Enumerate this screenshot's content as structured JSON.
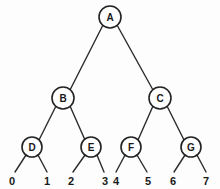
{
  "figure": {
    "name": "binary-tree-diagram",
    "type": "tree",
    "background_color": "#fdfdfd",
    "line_color": "#2b2b2b",
    "node_fill": "#ffffff",
    "node_stroke": "#222222",
    "text_color": "#1a1a1a"
  },
  "nodes": [
    {
      "id": "A",
      "label": "A",
      "cx": 110,
      "cy": 17,
      "r": 11,
      "level": 0
    },
    {
      "id": "B",
      "label": "B",
      "cx": 63,
      "cy": 98,
      "r": 11,
      "level": 1
    },
    {
      "id": "C",
      "label": "C",
      "cx": 160,
      "cy": 98,
      "r": 11,
      "level": 1
    },
    {
      "id": "D",
      "label": "D",
      "cx": 32,
      "cy": 147,
      "r": 10,
      "level": 2
    },
    {
      "id": "E",
      "label": "E",
      "cx": 91,
      "cy": 147,
      "r": 10,
      "level": 2
    },
    {
      "id": "F",
      "label": "F",
      "cx": 131,
      "cy": 147,
      "r": 10,
      "level": 2
    },
    {
      "id": "G",
      "label": "G",
      "cx": 191,
      "cy": 147,
      "r": 10,
      "level": 2
    }
  ],
  "edges": [
    {
      "from": "A",
      "to": "B",
      "x1": 103,
      "y1": 25,
      "x2": 70,
      "y2": 90
    },
    {
      "from": "A",
      "to": "C",
      "x1": 117,
      "y1": 25,
      "x2": 153,
      "y2": 90
    },
    {
      "from": "B",
      "to": "D",
      "x1": 56,
      "y1": 106,
      "x2": 39,
      "y2": 140
    },
    {
      "from": "B",
      "to": "E",
      "x1": 70,
      "y1": 106,
      "x2": 85,
      "y2": 140
    },
    {
      "from": "C",
      "to": "F",
      "x1": 153,
      "y1": 106,
      "x2": 138,
      "y2": 140
    },
    {
      "from": "C",
      "to": "G",
      "x1": 167,
      "y1": 106,
      "x2": 184,
      "y2": 140
    },
    {
      "from": "D",
      "to": "0",
      "x1": 26,
      "y1": 155,
      "x2": 15,
      "y2": 172
    },
    {
      "from": "D",
      "to": "1",
      "x1": 38,
      "y1": 155,
      "x2": 47,
      "y2": 172
    },
    {
      "from": "E",
      "to": "2",
      "x1": 85,
      "y1": 155,
      "x2": 73,
      "y2": 172
    },
    {
      "from": "E",
      "to": "3",
      "x1": 97,
      "y1": 155,
      "x2": 104,
      "y2": 172
    },
    {
      "from": "F",
      "to": "4",
      "x1": 125,
      "y1": 155,
      "x2": 116,
      "y2": 172
    },
    {
      "from": "F",
      "to": "5",
      "x1": 137,
      "y1": 155,
      "x2": 147,
      "y2": 172
    },
    {
      "from": "G",
      "to": "6",
      "x1": 185,
      "y1": 155,
      "x2": 174,
      "y2": 172
    },
    {
      "from": "G",
      "to": "7",
      "x1": 197,
      "y1": 155,
      "x2": 206,
      "y2": 172
    }
  ],
  "leaves": [
    {
      "label": "0",
      "x": 12,
      "y": 181,
      "parent": "D"
    },
    {
      "label": "1",
      "x": 47,
      "y": 181,
      "parent": "D"
    },
    {
      "label": "2",
      "x": 71,
      "y": 181,
      "parent": "E"
    },
    {
      "label": "3",
      "x": 105,
      "y": 181,
      "parent": "E"
    },
    {
      "label": "4",
      "x": 116,
      "y": 181,
      "parent": "F"
    },
    {
      "label": "5",
      "x": 148,
      "y": 181,
      "parent": "F"
    },
    {
      "label": "6",
      "x": 173,
      "y": 181,
      "parent": "G"
    },
    {
      "label": "7",
      "x": 206,
      "y": 181,
      "parent": "G"
    }
  ]
}
